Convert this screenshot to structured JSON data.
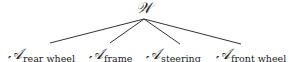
{
  "diagram": {
    "type": "tree",
    "root": {
      "symbol": "𝒲"
    },
    "children": [
      {
        "symbol": "𝒜",
        "subscript": "rear wheel"
      },
      {
        "symbol": "𝒜",
        "subscript": "frame"
      },
      {
        "symbol": "𝒜",
        "subscript": "steering"
      },
      {
        "symbol": "𝒜",
        "subscript": "front wheel"
      }
    ],
    "edge_color": "#333333"
  }
}
